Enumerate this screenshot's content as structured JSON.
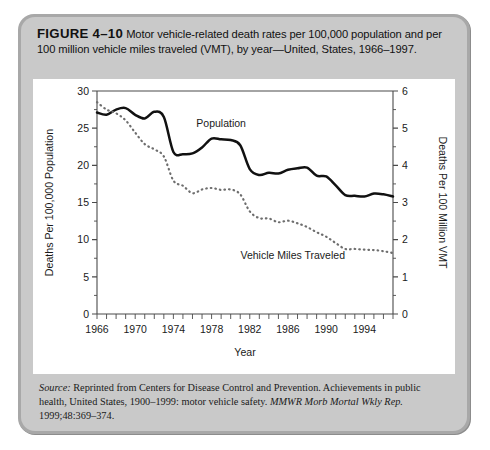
{
  "caption": {
    "figure_number": "FIGURE 4–10",
    "text": "Motor vehicle-related death rates per 100,000 population and per 100 million vehicle miles traveled (VMT), by year—United, States, 1966–1997."
  },
  "source": {
    "lead": "Source:",
    "body": " Reprinted from Centers for Disease Control and Prevention. Achievements in public health, United States, 1900–1999: motor vehicle safety. ",
    "journal": "MMWR Morb Mortal Wkly Rep.",
    "citation": " 1999;48:369–374."
  },
  "chart_data": {
    "type": "line",
    "title": "",
    "xlabel": "Year",
    "ylabel": "Deaths Per 100,000 Population",
    "y2label": "Deaths Per 100 Million VMT",
    "xlim": [
      1966,
      1997
    ],
    "ylim": [
      0,
      30
    ],
    "y2lim": [
      0,
      6
    ],
    "yticks": [
      0,
      5,
      10,
      15,
      20,
      25,
      30
    ],
    "y2ticks": [
      0,
      1,
      2,
      3,
      4,
      5,
      6
    ],
    "xticks": [
      1966,
      1970,
      1974,
      1978,
      1982,
      1986,
      1990,
      1994
    ],
    "xtick_step_minor": 1,
    "grid": false,
    "legend_position": "inline-annotation",
    "x": [
      1966,
      1967,
      1968,
      1969,
      1970,
      1971,
      1972,
      1973,
      1974,
      1975,
      1976,
      1977,
      1978,
      1979,
      1980,
      1981,
      1982,
      1983,
      1984,
      1985,
      1986,
      1987,
      1988,
      1989,
      1990,
      1991,
      1992,
      1993,
      1994,
      1995,
      1996,
      1997
    ],
    "series": [
      {
        "name": "Population",
        "style": "solid",
        "axis": "left",
        "units": "deaths per 100,000 population",
        "color": "#111111",
        "values": [
          27.1,
          26.8,
          27.5,
          27.7,
          26.8,
          26.3,
          27.2,
          26.5,
          21.8,
          21.5,
          21.6,
          22.4,
          23.6,
          23.5,
          23.4,
          22.7,
          19.5,
          18.7,
          19.0,
          18.9,
          19.4,
          19.6,
          19.7,
          18.6,
          18.5,
          17.3,
          16.0,
          15.9,
          15.8,
          16.2,
          16.1,
          15.8
        ]
      },
      {
        "name": "Vehicle Miles Traveled",
        "style": "dotted",
        "axis": "right",
        "units": "deaths per 100 million VMT",
        "color": "#6e6e6e",
        "values": [
          5.7,
          5.5,
          5.4,
          5.21,
          4.88,
          4.57,
          4.43,
          4.24,
          3.59,
          3.45,
          3.25,
          3.35,
          3.39,
          3.34,
          3.35,
          3.22,
          2.76,
          2.58,
          2.57,
          2.47,
          2.51,
          2.44,
          2.34,
          2.2,
          2.08,
          1.91,
          1.75,
          1.75,
          1.73,
          1.72,
          1.69,
          1.64
        ]
      }
    ],
    "annotations": [
      {
        "text": "Population",
        "x": 1979,
        "y": 25.2
      },
      {
        "text": "Vehicle Miles Traveled",
        "x": 1986.5,
        "y": 7.4
      }
    ]
  }
}
